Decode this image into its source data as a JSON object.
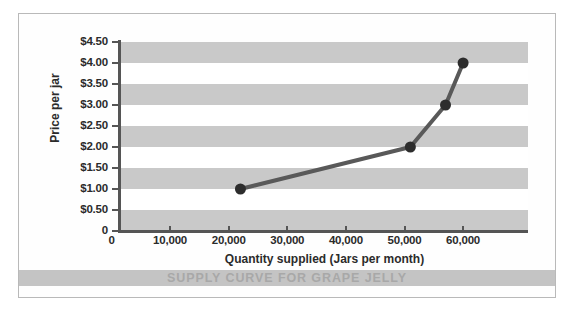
{
  "figure": {
    "caption": "SUPPLY CURVE FOR GRAPE JELLY",
    "bleed_text": " "
  },
  "colors": {
    "band": "#c9c9c9",
    "line": "#595959",
    "marker": "#2d2d2d",
    "axis": "#555555",
    "caption_bar": "#c4c4c4",
    "caption_text": "#a8a8a8",
    "border": "#b9b9b9"
  },
  "chart_data": {
    "type": "line",
    "title": "SUPPLY CURVE FOR GRAPE JELLY",
    "xlabel": "Quantity supplied (Jars per month)",
    "ylabel": "Price per jar",
    "xlim": [
      0,
      69000
    ],
    "ylim": [
      0,
      4.5
    ],
    "grid": "horizontal-bands",
    "legend": "none",
    "x_ticks": [
      0,
      10000,
      20000,
      30000,
      40000,
      50000,
      60000
    ],
    "x_tick_labels": [
      "0",
      "10,000",
      "20,000",
      "30,000",
      "40,000",
      "50,000",
      "60,000"
    ],
    "y_ticks": [
      0,
      0.5,
      1.0,
      1.5,
      2.0,
      2.5,
      3.0,
      3.5,
      4.0,
      4.5
    ],
    "y_tick_labels": [
      "0",
      "$0.50",
      "$1.00",
      "$1.50",
      "$2.00",
      "$2.50",
      "$3.00",
      "$3.50",
      "$4.00",
      "$4.50"
    ],
    "series": [
      {
        "name": "Supply",
        "x": [
          22000,
          51000,
          57000,
          60000
        ],
        "y": [
          1.0,
          2.0,
          3.0,
          4.0
        ],
        "marker": "circle",
        "marker_size": 11,
        "line_width": 4
      }
    ],
    "points": [
      {
        "quantity": 22000,
        "price": 1.0
      },
      {
        "quantity": 51000,
        "price": 2.0
      },
      {
        "quantity": 57000,
        "price": 3.0
      },
      {
        "quantity": 60000,
        "price": 4.0
      }
    ]
  }
}
